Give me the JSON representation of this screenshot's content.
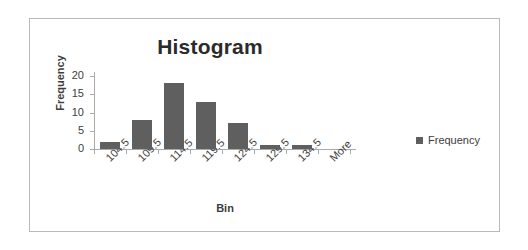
{
  "chart_data": {
    "type": "bar",
    "title": "Histogram",
    "xlabel": "Bin",
    "ylabel": "Frequency",
    "categories": [
      "104.5",
      "109.5",
      "114.5",
      "119.5",
      "124.5",
      "129.5",
      "134.5",
      "More"
    ],
    "values": [
      2,
      8,
      18,
      13,
      7,
      1,
      1,
      0
    ],
    "series": [
      {
        "name": "Frequency",
        "values": [
          2,
          8,
          18,
          13,
          7,
          1,
          1,
          0
        ]
      }
    ],
    "yticks": [
      "0",
      "5",
      "10",
      "15",
      "20"
    ],
    "ylim": [
      0,
      20
    ],
    "grid": false,
    "legend": {
      "position": "right",
      "entries": [
        "Frequency"
      ]
    },
    "colors": {
      "bar": "#5f5f5f",
      "axis": "#aaaaaa",
      "text": "#3d3d3d",
      "frame": "#b9b9b9"
    }
  }
}
